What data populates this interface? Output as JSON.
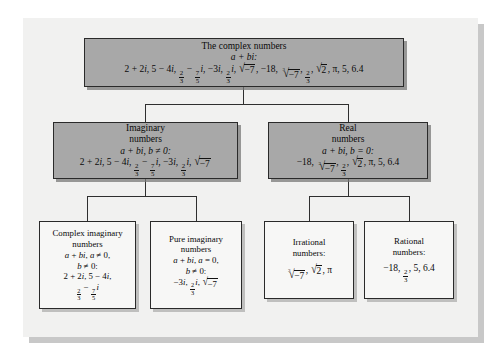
{
  "figure": {
    "type": "tree-diagram"
  },
  "nodes": {
    "complex": {
      "title": "The complex numbers",
      "form": "a + bi:",
      "members_plain": "2 + 2i, 5 − 4i, 2/3 − 7/5 i, −3i, 2/3 i, √−7, −18, ∛−7, 2/3, √2, π, 5, 6.4"
    },
    "imaginary": {
      "title_line1": "Imaginary",
      "title_line2": "numbers",
      "condition": "a + bi, b ≠ 0:",
      "members_plain": "2 + 2i, 5 − 4i, 2/3 − 7/5 i, −3i, 2/3 i, √−7"
    },
    "real": {
      "title_line1": "Real",
      "title_line2": "numbers",
      "condition": "a + bi, b = 0:",
      "members_plain": "−18, ∛−7, 2/3, √2, π, 5, 6.4"
    },
    "complex_imaginary": {
      "title_line1": "Complex imaginary",
      "title_line2": "numbers",
      "condition_line1": "a + bi, a ≠ 0,",
      "condition_line2": "b ≠ 0:",
      "members_line1": "2 + 2i, 5 − 4i,",
      "members_line2": "2/3 − 7/5 i"
    },
    "pure_imaginary": {
      "title_line1": "Pure imaginary",
      "title_line2": "numbers",
      "condition_line1": "a + bi, a = 0,",
      "condition_line2": "b ≠ 0:",
      "members_line1": "−3i, 2/3 i, √−7"
    },
    "irrational": {
      "title_line1": "Irrational",
      "title_line2": "numbers:",
      "members_line1": "∛−7, √2, π"
    },
    "rational": {
      "title_line1": "Rational",
      "title_line2": "numbers:",
      "members_line1": "−18, 2/3, 5, 6.4"
    }
  },
  "colors": {
    "page_background": "#ffffff",
    "panel_background": "#f1f1f0",
    "shaded_box_fill": "#a8a8a8",
    "plain_box_fill": "#f7f7f6",
    "box_border": "#2a2a2a",
    "connector": "#2f2f2f",
    "text": "#0a0a0a"
  }
}
